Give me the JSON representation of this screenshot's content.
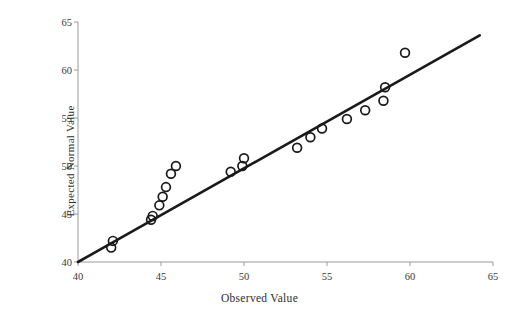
{
  "chart_data": {
    "type": "scatter",
    "title": "",
    "xlabel": "Observed Value",
    "ylabel": "Expected Normal Value",
    "xlim": [
      40,
      65
    ],
    "ylim": [
      40,
      65
    ],
    "xticks": [
      40,
      45,
      50,
      55,
      60,
      65
    ],
    "yticks": [
      40,
      45,
      50,
      55,
      60,
      65
    ],
    "grid": false,
    "legend": null,
    "marker": "open-circle",
    "marker_color": "#1a1a1a",
    "marker_fill": "none",
    "line_color": "#1a1a1a",
    "reference_line": {
      "label": "normal reference line",
      "x": [
        40,
        64.2
      ],
      "y": [
        40,
        63.6
      ]
    },
    "series": [
      {
        "name": "Normal Q-Q",
        "points": [
          {
            "x": 42.0,
            "y": 41.5
          },
          {
            "x": 42.1,
            "y": 42.2
          },
          {
            "x": 44.4,
            "y": 44.4
          },
          {
            "x": 44.5,
            "y": 44.8
          },
          {
            "x": 44.9,
            "y": 45.9
          },
          {
            "x": 45.1,
            "y": 46.8
          },
          {
            "x": 45.3,
            "y": 47.8
          },
          {
            "x": 45.6,
            "y": 49.2
          },
          {
            "x": 45.9,
            "y": 50.0
          },
          {
            "x": 49.2,
            "y": 49.4
          },
          {
            "x": 49.9,
            "y": 50.0
          },
          {
            "x": 50.0,
            "y": 50.8
          },
          {
            "x": 53.2,
            "y": 51.9
          },
          {
            "x": 54.0,
            "y": 53.0
          },
          {
            "x": 54.7,
            "y": 53.9
          },
          {
            "x": 56.2,
            "y": 54.9
          },
          {
            "x": 57.3,
            "y": 55.8
          },
          {
            "x": 58.4,
            "y": 56.8
          },
          {
            "x": 58.5,
            "y": 58.2
          },
          {
            "x": 59.7,
            "y": 61.8
          }
        ]
      }
    ]
  },
  "axes": {
    "x_tick_labels": [
      "40",
      "45",
      "50",
      "55",
      "60",
      "65"
    ],
    "y_tick_labels": [
      "40",
      "45",
      "50",
      "55",
      "60",
      "65"
    ],
    "x_title": "Observed Value",
    "y_title": "Expected Normal Value"
  },
  "style": {
    "axis_color": "#9a9a9a",
    "tick_text_color": "#3a3a3a",
    "data_color": "#1a1a1a",
    "background": "#ffffff"
  }
}
